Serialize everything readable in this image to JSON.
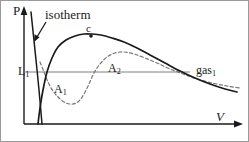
{
  "figure": {
    "background_color": "#ffffff",
    "ink_color": "#1a1a1a",
    "tie_line_color": "#808080",
    "dashed_curve_color": "#777777"
  },
  "axes": {
    "y_label": "P",
    "x_label": "V",
    "y_arrow": "up-arrow",
    "x_arrow": "right-arrow"
  },
  "annotations": {
    "isotherm_label": "isotherm",
    "critical_point_label": "c",
    "liquid_label": "L",
    "liquid_subscript": "1",
    "gas_label": "gas",
    "gas_subscript": "1",
    "area_below_label": "A",
    "area_below_subscript": "1",
    "area_above_label": "A",
    "area_above_subscript": "2"
  },
  "chart_data": {
    "type": "line",
    "title": "",
    "xlabel": "V",
    "ylabel": "P",
    "grid": false,
    "legend": null,
    "xlim": [
      0,
      249
    ],
    "ylim": [
      142,
      0
    ],
    "annotations": [
      {
        "name": "isotherm",
        "text": "isotherm",
        "x": 45,
        "y": 8,
        "has_arrow": true,
        "arrow_from": [
          46,
          22
        ],
        "arrow_to": [
          35,
          40
        ]
      },
      {
        "name": "critical-point",
        "text": "c",
        "x": 88,
        "y": 25,
        "marker": {
          "x": 91,
          "y": 36,
          "r": 1.8,
          "filled": true
        }
      },
      {
        "name": "liquid-point",
        "text": "L1",
        "x": 18,
        "y": 65
      },
      {
        "name": "gas-point",
        "text": "gas1",
        "x": 196,
        "y": 64
      },
      {
        "name": "area-one",
        "text": "A1",
        "x": 54,
        "y": 83
      },
      {
        "name": "area-two",
        "text": "A2",
        "x": 108,
        "y": 62
      }
    ],
    "series": [
      {
        "name": "binodal-coexistence-curve",
        "style": "solid",
        "color": "#1a1a1a",
        "points": [
          [
            38,
            124
          ],
          [
            40,
            108
          ],
          [
            43,
            90
          ],
          [
            47,
            72
          ],
          [
            52,
            58
          ],
          [
            58,
            47
          ],
          [
            66,
            40
          ],
          [
            75,
            36
          ],
          [
            84,
            34
          ],
          [
            92,
            34
          ],
          [
            101,
            35
          ],
          [
            112,
            38
          ],
          [
            124,
            42
          ],
          [
            137,
            48
          ],
          [
            150,
            55
          ],
          [
            165,
            63
          ],
          [
            180,
            71
          ],
          [
            195,
            78
          ],
          [
            210,
            84
          ],
          [
            225,
            89
          ],
          [
            237,
            92
          ]
        ]
      },
      {
        "name": "vanderwaals-isotherm-dashed",
        "style": "dashed",
        "color": "#777777",
        "points": [
          [
            40,
            62
          ],
          [
            44,
            72
          ],
          [
            48,
            82
          ],
          [
            53,
            91
          ],
          [
            59,
            98
          ],
          [
            66,
            103
          ],
          [
            73,
            104
          ],
          [
            79,
            101
          ],
          [
            84,
            94
          ],
          [
            89,
            84
          ],
          [
            94,
            73
          ],
          [
            100,
            64
          ],
          [
            107,
            57
          ],
          [
            115,
            53
          ],
          [
            124,
            52
          ],
          [
            134,
            54
          ],
          [
            145,
            58
          ],
          [
            157,
            63
          ],
          [
            170,
            69
          ],
          [
            183,
            74
          ],
          [
            197,
            79
          ],
          [
            212,
            83
          ],
          [
            227,
            86
          ],
          [
            240,
            88
          ]
        ]
      },
      {
        "name": "liquid-branch-steep-line",
        "style": "solid",
        "color": "#1a1a1a",
        "points": [
          [
            31,
            12
          ],
          [
            36,
            60
          ],
          [
            39,
            90
          ],
          [
            42,
            124
          ]
        ]
      },
      {
        "name": "maxwell-tie-line",
        "style": "solid",
        "color": "#808080",
        "points": [
          [
            24,
            72
          ],
          [
            190,
            72
          ]
        ]
      }
    ]
  }
}
